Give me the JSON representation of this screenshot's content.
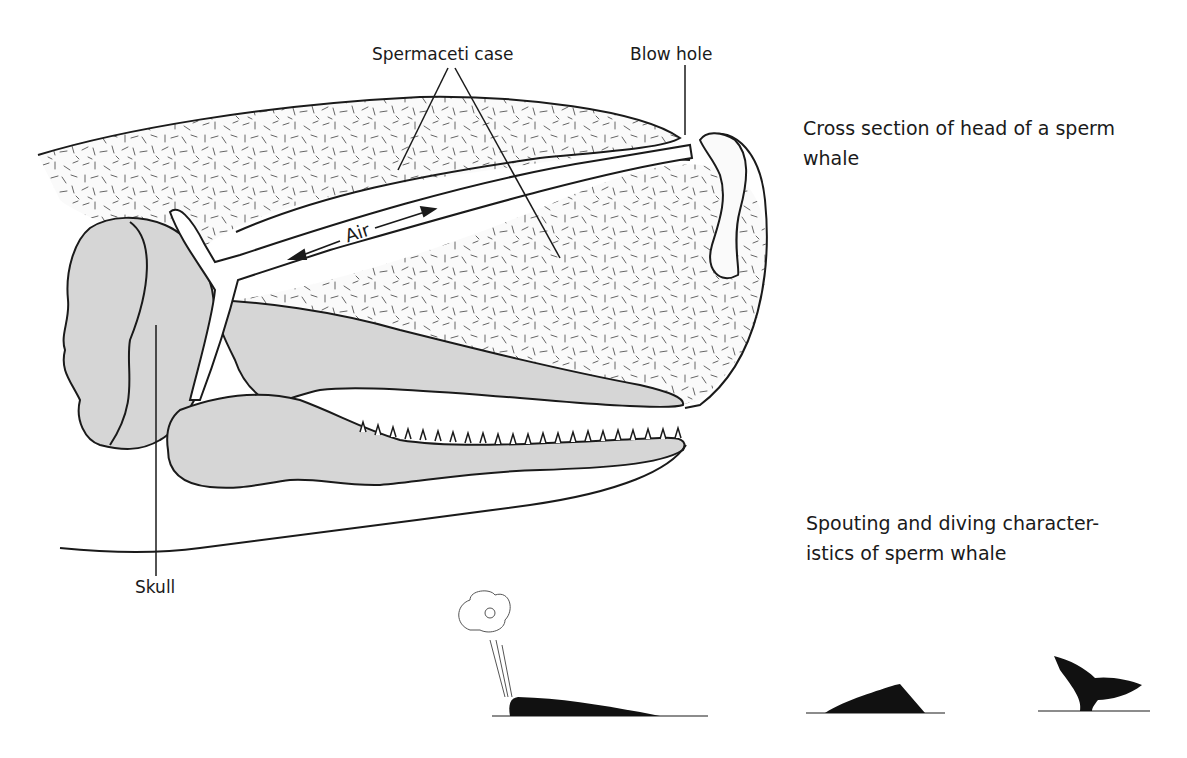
{
  "diagram": {
    "labels": {
      "spermaceti_case": "Spermaceti case",
      "blow_hole": "Blow hole",
      "air": "Air",
      "skull": "Skull"
    },
    "captions": {
      "cross_section_line1": "Cross section of head of a sperm",
      "cross_section_line2": "whale",
      "spouting_line1": "Spouting and diving character-",
      "spouting_line2": "istics of sperm whale"
    },
    "colors": {
      "outline": "#1a1a1a",
      "bone_fill": "#d6d6d6",
      "tissue_fill": "#fafafa",
      "silhouette": "#111111"
    },
    "silhouettes": [
      {
        "name": "spouting-whale",
        "stage": "spouting"
      },
      {
        "name": "surfacing-back",
        "stage": "rounding out"
      },
      {
        "name": "diving-flukes",
        "stage": "diving"
      }
    ]
  }
}
